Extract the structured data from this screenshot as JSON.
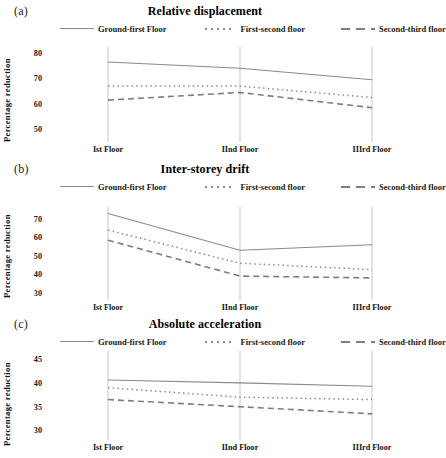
{
  "figure": {
    "panels": [
      {
        "tag": "(a)",
        "title": "Relative displacement",
        "ylabel": "Percentage reduction",
        "yticks": [
          "50",
          "60",
          "70",
          "80"
        ],
        "ylim": [
          45,
          82
        ],
        "xticks": [
          "Ist Floor",
          "IInd Floor",
          "IIIrd Floor"
        ]
      },
      {
        "tag": "(b)",
        "title": "Inter-storey drift",
        "ylabel": "Percentage reduction",
        "yticks": [
          "30",
          "40",
          "50",
          "60",
          "70"
        ],
        "ylim": [
          26,
          76
        ],
        "xticks": [
          "Ist Floor",
          "IInd Floor",
          "IIIrd Floor"
        ]
      },
      {
        "tag": "(c)",
        "title": "Absolute acceleration",
        "ylabel": "Percentage reduction",
        "yticks": [
          "30",
          "35",
          "40",
          "45"
        ],
        "ylim": [
          28,
          46.5
        ],
        "xticks": [
          "Ist Floor",
          "IInd Floor",
          "IIIrd Floor"
        ]
      }
    ],
    "legend": [
      {
        "label": "Ground-first Floor",
        "style": "solid",
        "color": "#8a8a8a"
      },
      {
        "label": "First-second floor",
        "style": "dotted",
        "color": "#8a8a8a"
      },
      {
        "label": "Second-third floor",
        "style": "dashed",
        "color": "#7d7d7d"
      }
    ]
  },
  "chart_data": [
    {
      "type": "line",
      "title": "Relative displacement",
      "panel": "(a)",
      "xlabel": "",
      "ylabel": "Percentage reduction",
      "categories": [
        "Ist Floor",
        "IInd Floor",
        "IIIrd Floor"
      ],
      "ylim": [
        45,
        82
      ],
      "yticks": [
        50,
        60,
        70,
        80
      ],
      "grid": false,
      "legend_position": "top",
      "series": [
        {
          "name": "Ground-first Floor",
          "style": "solid",
          "values": [
            76.5,
            74.0,
            69.5
          ]
        },
        {
          "name": "First-second floor",
          "style": "dotted",
          "values": [
            67.0,
            67.0,
            62.5
          ]
        },
        {
          "name": "Second-third floor",
          "style": "dashed",
          "values": [
            61.5,
            64.5,
            58.5
          ]
        }
      ]
    },
    {
      "type": "line",
      "title": "Inter-storey drift",
      "panel": "(b)",
      "xlabel": "",
      "ylabel": "Percentage reduction",
      "categories": [
        "Ist Floor",
        "IInd Floor",
        "IIIrd Floor"
      ],
      "ylim": [
        26,
        76
      ],
      "yticks": [
        30,
        40,
        50,
        60,
        70
      ],
      "grid": false,
      "legend_position": "top",
      "series": [
        {
          "name": "Ground-first Floor",
          "style": "solid",
          "values": [
            73.0,
            53.0,
            56.0
          ]
        },
        {
          "name": "First-second floor",
          "style": "dotted",
          "values": [
            64.0,
            46.0,
            42.5
          ]
        },
        {
          "name": "Second-third floor",
          "style": "dashed",
          "values": [
            58.5,
            39.0,
            38.0
          ]
        }
      ]
    },
    {
      "type": "line",
      "title": "Absolute acceleration",
      "panel": "(c)",
      "xlabel": "",
      "ylabel": "Percentage reduction",
      "categories": [
        "Ist Floor",
        "IInd Floor",
        "IIIrd Floor"
      ],
      "ylim": [
        28,
        46.5
      ],
      "yticks": [
        30,
        35,
        40,
        45
      ],
      "grid": false,
      "legend_position": "top",
      "series": [
        {
          "name": "Ground-first Floor",
          "style": "solid",
          "values": [
            40.6,
            40.0,
            39.3
          ]
        },
        {
          "name": "First-second floor",
          "style": "dotted",
          "values": [
            39.0,
            37.0,
            36.5
          ]
        },
        {
          "name": "Second-third floor",
          "style": "dashed",
          "values": [
            36.5,
            35.0,
            33.5
          ]
        }
      ]
    }
  ]
}
